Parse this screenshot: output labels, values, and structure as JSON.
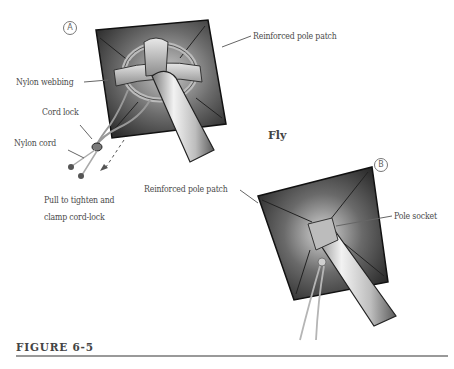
{
  "figure": {
    "caption": "FIGURE 6-5",
    "center_title": "Fly"
  },
  "panel_a": {
    "marker": "A",
    "labels": {
      "reinforced_pole_patch": "Reinforced pole patch",
      "nylon_webbing": "Nylon webbing",
      "cord_lock": "Cord lock",
      "nylon_cord": "Nylon cord",
      "pull_instruction_line1": "Pull to tighten and",
      "pull_instruction_line2": "clamp cord-lock"
    }
  },
  "panel_b": {
    "marker": "B",
    "labels": {
      "reinforced_pole_patch": "Reinforced pole patch",
      "pole_socket": "Pole socket"
    }
  },
  "colors": {
    "patch_dark": "#3a3a3a",
    "patch_mid": "#8a8a8a",
    "pole_light": "#d8d8d8",
    "text": "#4a4a4a",
    "rule": "#999999"
  }
}
